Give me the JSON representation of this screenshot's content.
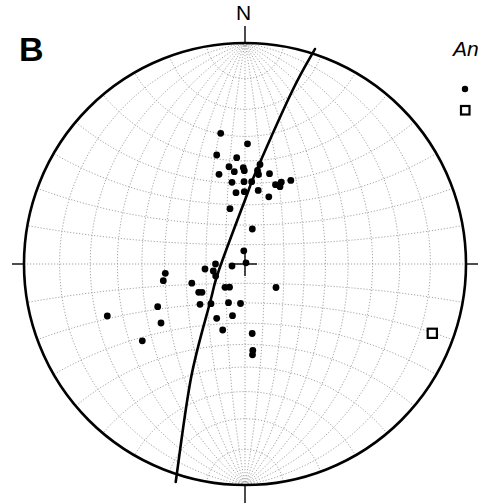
{
  "figure": {
    "panel_label": "B",
    "north_label": "N",
    "legend_title": "An",
    "legend_items": [
      {
        "symbol": "filled-circle",
        "label": ""
      },
      {
        "symbol": "open-square",
        "label": ""
      }
    ]
  },
  "chart_data": {
    "type": "scatter",
    "subtype": "stereonet-lower-hemisphere",
    "title": "B",
    "north_label": "N",
    "legend": {
      "title": "An",
      "entries": [
        "filled circle",
        "open square"
      ],
      "position": "top-right"
    },
    "net": {
      "center_px": [
        245,
        264
      ],
      "radius_px": 221,
      "grid_spacing_deg": 10,
      "grid": true
    },
    "series": [
      {
        "name": "filled-circle",
        "marker": "circle",
        "color": "#000000",
        "points_px": [
          [
            220.7,
            133.3
          ],
          [
            247.5,
            143.8
          ],
          [
            216.7,
            155
          ],
          [
            236.7,
            157.7
          ],
          [
            260,
            164.5
          ],
          [
            229,
            166.7
          ],
          [
            243.3,
            167.7
          ],
          [
            244.3,
            170.7
          ],
          [
            257.5,
            170.5
          ],
          [
            234.3,
            171.7
          ],
          [
            219,
            174.3
          ],
          [
            258.5,
            174.5
          ],
          [
            269.5,
            173.7
          ],
          [
            232,
            182.3
          ],
          [
            244,
            181.7
          ],
          [
            251.7,
            181.7
          ],
          [
            275.5,
            184.7
          ],
          [
            281.3,
            182.2
          ],
          [
            290.8,
            180.4
          ],
          [
            280,
            186.7
          ],
          [
            236,
            192.7
          ],
          [
            244.3,
            191.7
          ],
          [
            258.2,
            190.4
          ],
          [
            268.8,
            196.8
          ],
          [
            230,
            208.7
          ],
          [
            252.3,
            229
          ],
          [
            243.8,
            250.8
          ],
          [
            246,
            262.8
          ],
          [
            232,
            266
          ],
          [
            215.5,
            264
          ],
          [
            205,
            269
          ],
          [
            213.3,
            271
          ],
          [
            215.7,
            276
          ],
          [
            165.3,
            273.3
          ],
          [
            163.3,
            280.7
          ],
          [
            191.8,
            283.2
          ],
          [
            198.7,
            292.3
          ],
          [
            202,
            292.3
          ],
          [
            225,
            287.3
          ],
          [
            229.5,
            287.2
          ],
          [
            276,
            287.5
          ],
          [
            157.7,
            306.7
          ],
          [
            200,
            304.3
          ],
          [
            211,
            303.7
          ],
          [
            228.5,
            302.7
          ],
          [
            240.5,
            303.5
          ],
          [
            161,
            323
          ],
          [
            216.7,
            318.3
          ],
          [
            232.5,
            315.7
          ],
          [
            222.7,
            330
          ],
          [
            107.3,
            316
          ],
          [
            142.3,
            340.8
          ],
          [
            252.2,
            333.5
          ],
          [
            252.8,
            350.4
          ],
          [
            252.5,
            354.8
          ]
        ]
      },
      {
        "name": "open-square",
        "marker": "square",
        "color": "#000000",
        "points_px": [
          [
            432.3,
            333.3
          ]
        ]
      }
    ],
    "great_circles": [
      {
        "name": "plane",
        "path_px": [
          [
            315,
            49
          ],
          [
            292.7,
            90
          ],
          [
            256.7,
            170
          ],
          [
            245,
            200
          ],
          [
            219,
            270
          ],
          [
            210.7,
            300
          ],
          [
            191,
            378
          ],
          [
            175.7,
            482
          ]
        ]
      }
    ]
  }
}
